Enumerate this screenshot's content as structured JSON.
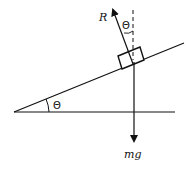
{
  "diagram": {
    "labels": {
      "normal_force": "R",
      "weight": "mg",
      "incline_angle": "Θ",
      "force_angle": "Θ"
    },
    "colors": {
      "stroke": "#111111",
      "background": "#ffffff"
    }
  }
}
